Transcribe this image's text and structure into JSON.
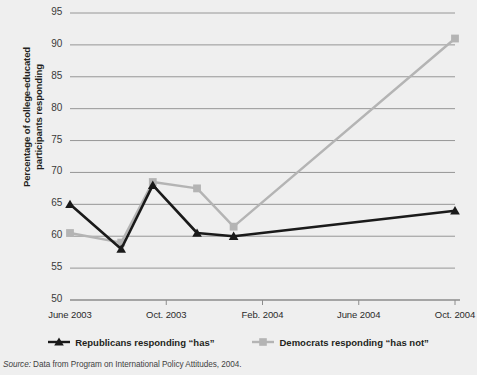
{
  "axis": {
    "ylabel": "Percentage of college-educated participants responding",
    "yticks": [
      "95",
      "90",
      "85",
      "80",
      "75",
      "70",
      "65",
      "60",
      "55",
      "50"
    ],
    "xticks": [
      "June 2003",
      "Oct. 2003",
      "Feb. 2004",
      "June 2004",
      "Oct. 2004"
    ]
  },
  "legend": {
    "items": [
      {
        "label": "Republicans responding “has”",
        "color": "#1a1a1a",
        "marker": "triangle"
      },
      {
        "label": "Democrats responding “has not”",
        "color": "#b4b4b4",
        "marker": "square"
      }
    ]
  },
  "source": {
    "prefix": "Source:",
    "text": " Data from Program on International Policy Attitudes, 2004."
  },
  "chart_data": {
    "type": "line",
    "title": "",
    "xlabel": "",
    "ylabel": "Percentage of college-educated participants responding",
    "ylim": [
      50,
      95
    ],
    "ytick_values": [
      50,
      55,
      60,
      65,
      70,
      75,
      80,
      85,
      90,
      95
    ],
    "xtick_labels": [
      "June 2003",
      "Oct. 2003",
      "Feb. 2004",
      "June 2004",
      "Oct. 2004"
    ],
    "grid": "horizontal",
    "legend_position": "below-axes",
    "series": [
      {
        "name": "Republicans responding “has”",
        "color": "#1a1a1a",
        "marker": "triangle",
        "points": [
          {
            "x": "June 2003",
            "x_frac": 0.0,
            "y": 65.0
          },
          {
            "x": "Aug. 2003",
            "x_frac": 0.133,
            "y": 58.0
          },
          {
            "x": "Sep. 2003",
            "x_frac": 0.215,
            "y": 68.0
          },
          {
            "x": "Oct. 2003",
            "x_frac": 0.33,
            "y": 60.5
          },
          {
            "x": "Nov. 2003",
            "x_frac": 0.425,
            "y": 60.0
          },
          {
            "x": "Oct. 2004",
            "x_frac": 1.0,
            "y": 64.0
          }
        ]
      },
      {
        "name": "Democrats responding “has not”",
        "color": "#b4b4b4",
        "marker": "square",
        "points": [
          {
            "x": "June 2003",
            "x_frac": 0.0,
            "y": 60.5
          },
          {
            "x": "Aug. 2003",
            "x_frac": 0.133,
            "y": 59.0
          },
          {
            "x": "Sep. 2003",
            "x_frac": 0.215,
            "y": 68.5
          },
          {
            "x": "Oct. 2003",
            "x_frac": 0.33,
            "y": 67.5
          },
          {
            "x": "Nov. 2003",
            "x_frac": 0.425,
            "y": 61.5
          },
          {
            "x": "Oct. 2004",
            "x_frac": 1.0,
            "y": 91.0
          }
        ]
      }
    ]
  }
}
